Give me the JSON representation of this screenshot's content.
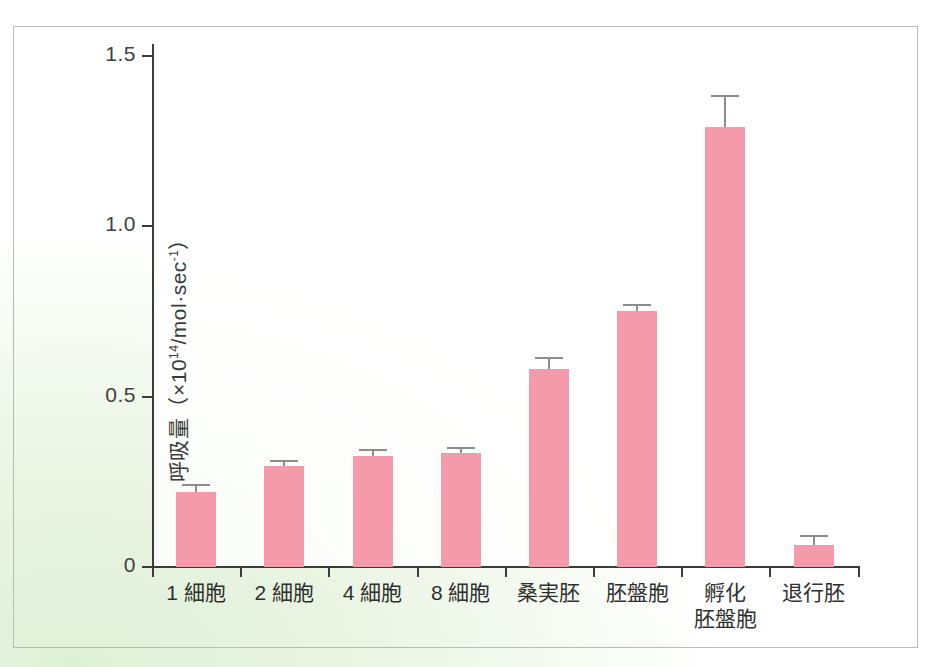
{
  "chart_data": {
    "type": "bar",
    "title": "",
    "subtitle": "",
    "xlabel": "",
    "ylabel_parts": {
      "prefix": "呼吸量（×10",
      "exponent": "14",
      "suffix": "/mol·sec",
      "exponent2": "-1",
      "close": "）"
    },
    "ylabel": "呼吸量（×10^14/mol·sec^-1）",
    "categories": [
      "1 細胞",
      "2 細胞",
      "4 細胞",
      "8 細胞",
      "桑実胚",
      "胚盤胞",
      "孵化\n胚盤胞",
      "退行胚"
    ],
    "values": [
      0.22,
      0.295,
      0.325,
      0.335,
      0.58,
      0.75,
      1.29,
      0.065
    ],
    "errors": [
      0.022,
      0.018,
      0.022,
      0.018,
      0.035,
      0.022,
      0.095,
      0.03
    ],
    "ylim": [
      0,
      1.58
    ],
    "yticks": [
      0,
      0.5,
      1.0,
      1.5
    ],
    "ytick_labels": [
      "0",
      "0.5",
      "1.0",
      "1.5"
    ],
    "grid": false,
    "legend": "none",
    "bar_color": "#f59aab",
    "error_color": "#8d8d8d",
    "axis_color": "#3b3b3b",
    "background_color": "#e7f3e0",
    "frame_color": "#b9bcb9"
  }
}
